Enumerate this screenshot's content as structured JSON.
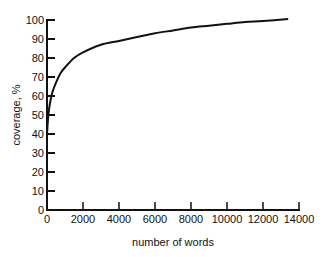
{
  "chart_data": {
    "type": "line",
    "title": "",
    "xlabel": "number of words",
    "ylabel": "coverage, %",
    "xlim": [
      0,
      14000
    ],
    "ylim": [
      0,
      100
    ],
    "grid": false,
    "legend": null,
    "x_ticks": [
      0,
      2000,
      4000,
      6000,
      8000,
      10000,
      12000,
      14000
    ],
    "y_ticks": [
      0,
      10,
      20,
      30,
      40,
      50,
      60,
      70,
      80,
      90,
      100
    ],
    "series": [
      {
        "name": "coverage",
        "color": "#111111",
        "x": [
          0,
          50,
          100,
          200,
          300,
          500,
          750,
          1000,
          1500,
          2000,
          3000,
          4000,
          5000,
          6000,
          7000,
          8000,
          9000,
          10000,
          11000,
          12000,
          13400
        ],
        "y": [
          40,
          47,
          52,
          58,
          62,
          67,
          72,
          75,
          80,
          83,
          87,
          89,
          91,
          93,
          94.5,
          96,
          97,
          98,
          99,
          99.5,
          100.5
        ]
      }
    ]
  }
}
